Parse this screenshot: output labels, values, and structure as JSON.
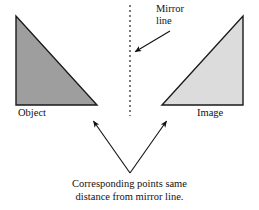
{
  "figure": {
    "title_label": "Mirror line",
    "background_color": "#ffffff",
    "labels": {
      "mirror_line_1": "Mirror",
      "mirror_line_2": "line",
      "object": "Object",
      "image": "Image"
    },
    "caption": {
      "line1": "Corresponding points same",
      "line2": "distance from mirror line."
    },
    "colors": {
      "object_fill": "#9e9e9e",
      "image_fill": "#dcdcdc",
      "stroke": "#1a1a1a",
      "text": "#111111",
      "mirror_line": "#333333"
    },
    "geometry": {
      "object_triangle": {
        "name": "Object",
        "points": "16,16 16,105 97,105",
        "fill": "#9e9e9e"
      },
      "image_triangle": {
        "name": "Image",
        "points": "243,16 243,105 162,105",
        "fill": "#dcdcdc"
      },
      "mirror_line": {
        "x": 130,
        "y_top": 5,
        "y_bottom": 116,
        "dash": "2,3"
      },
      "mirror_pointer_arrow": {
        "from_x": 170,
        "from_y": 31,
        "to_x": 133,
        "to_y": 53
      },
      "correspondence_arrow_left": {
        "from_x": 130,
        "from_y": 173,
        "to_x": 92,
        "to_y": 119
      },
      "correspondence_arrow_right": {
        "from_x": 130,
        "from_y": 173,
        "to_x": 168,
        "to_y": 119
      }
    }
  }
}
